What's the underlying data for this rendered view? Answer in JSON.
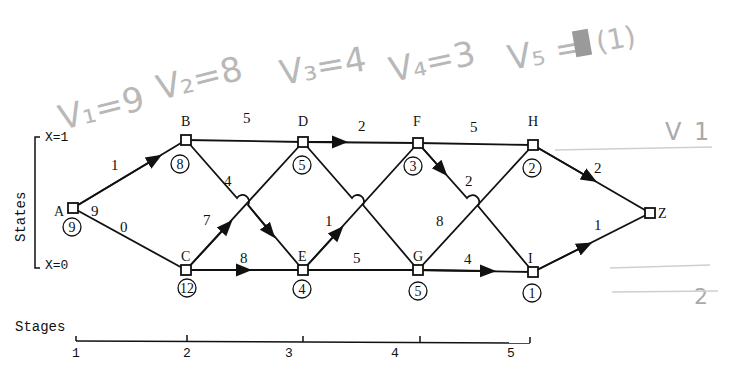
{
  "annotations": {
    "v1": "V₁=9",
    "v2": "V₂=8",
    "v3": "V₃=4",
    "v4": "V₄=3",
    "v5_prefix": "V₅ =",
    "v5_value": "(1)",
    "right_mark_top": "1",
    "right_mark_bottom": "2"
  },
  "axes": {
    "states_label": "States",
    "x1_label": "X=1",
    "x0_label": "X=0",
    "stages_label": "Stages",
    "stage_ticks": [
      "1",
      "2",
      "3",
      "4",
      "5"
    ]
  },
  "nodes": [
    {
      "id": "A",
      "label": "A",
      "value": "9"
    },
    {
      "id": "B",
      "label": "B",
      "value": "8"
    },
    {
      "id": "C",
      "label": "C",
      "value": "12"
    },
    {
      "id": "D",
      "label": "D",
      "value": "5"
    },
    {
      "id": "E",
      "label": "E",
      "value": "4"
    },
    {
      "id": "F",
      "label": "F",
      "value": "3"
    },
    {
      "id": "G",
      "label": "G",
      "value": "5"
    },
    {
      "id": "H",
      "label": "H",
      "value": "2"
    },
    {
      "id": "I",
      "label": "I",
      "value": "1"
    },
    {
      "id": "Z",
      "label": "Z"
    }
  ],
  "edges": [
    {
      "from": "A",
      "to": "B",
      "weight": "1"
    },
    {
      "from": "A",
      "to": "C",
      "weight": "0"
    },
    {
      "from": "A",
      "to": "A",
      "weight": "9"
    },
    {
      "from": "B",
      "to": "D",
      "weight": "5"
    },
    {
      "from": "B",
      "to": "E",
      "weight": "4"
    },
    {
      "from": "C",
      "to": "D",
      "weight": "7"
    },
    {
      "from": "C",
      "to": "E",
      "weight": "8"
    },
    {
      "from": "D",
      "to": "F",
      "weight": "2"
    },
    {
      "from": "E",
      "to": "F",
      "weight": "1"
    },
    {
      "from": "E",
      "to": "G",
      "weight": "5"
    },
    {
      "from": "F",
      "to": "H",
      "weight": "5"
    },
    {
      "from": "F",
      "to": "I",
      "weight": "2"
    },
    {
      "from": "G",
      "to": "H",
      "weight": "8"
    },
    {
      "from": "G",
      "to": "I",
      "weight": "4"
    },
    {
      "from": "H",
      "to": "Z",
      "weight": "2"
    },
    {
      "from": "I",
      "to": "Z",
      "weight": "1"
    }
  ]
}
